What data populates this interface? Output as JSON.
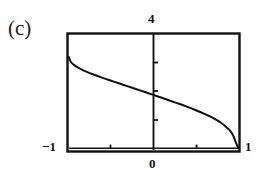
{
  "figure": {
    "panel_label": "(c)",
    "background_color": "#ffffff",
    "ink_color": "#111111"
  },
  "chart_data": {
    "type": "line",
    "title": "(c)",
    "xlabel": "",
    "ylabel": "",
    "xlim": [
      -1,
      1
    ],
    "ylim": [
      0,
      4
    ],
    "grid": false,
    "legend": null,
    "axis_labels": {
      "x_left": "−1",
      "x_right": "1",
      "x_center": "0",
      "y_top": "4"
    },
    "tick_labels": {
      "x": [
        "−1",
        "0",
        "1"
      ],
      "y": [
        "0",
        "4"
      ]
    },
    "x_ticks": [
      -1,
      -0.5,
      0,
      0.5,
      1
    ],
    "y_ticks": [
      0,
      1,
      2,
      3,
      4
    ],
    "series": [
      {
        "name": "curve",
        "color": "#111111",
        "x": [
          -1.0,
          -0.98,
          -0.96,
          -0.93,
          -0.9,
          -0.85,
          -0.8,
          -0.7,
          -0.6,
          -0.5,
          -0.4,
          -0.3,
          -0.2,
          -0.1,
          0.0,
          0.1,
          0.2,
          0.3,
          0.4,
          0.5,
          0.6,
          0.7,
          0.8,
          0.86,
          0.9,
          0.94,
          0.97,
          0.99,
          1.0
        ],
        "y": [
          3.22,
          3.07,
          2.99,
          2.92,
          2.86,
          2.78,
          2.71,
          2.59,
          2.48,
          2.38,
          2.28,
          2.18,
          2.08,
          1.98,
          1.88,
          1.78,
          1.67,
          1.57,
          1.46,
          1.34,
          1.21,
          1.07,
          0.89,
          0.74,
          0.63,
          0.45,
          0.22,
          0.07,
          0.0
        ]
      }
    ],
    "annotations": []
  }
}
